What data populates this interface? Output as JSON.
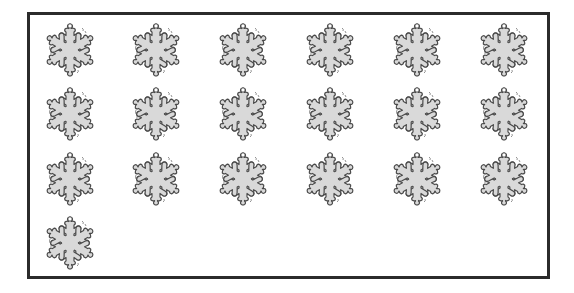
{
  "worksheet": {
    "item_icon": "snowflake-icon",
    "item_count": 19,
    "columns": 6,
    "rows": 4,
    "colors": {
      "border": "#2b2b2b",
      "flake_fill": "#d9d9d9",
      "flake_outline": "#4a4a4a",
      "background": "#ffffff"
    },
    "items": [
      {
        "row": 0,
        "col": 0
      },
      {
        "row": 0,
        "col": 1
      },
      {
        "row": 0,
        "col": 2
      },
      {
        "row": 0,
        "col": 3
      },
      {
        "row": 0,
        "col": 4
      },
      {
        "row": 0,
        "col": 5
      },
      {
        "row": 1,
        "col": 0
      },
      {
        "row": 1,
        "col": 1
      },
      {
        "row": 1,
        "col": 2
      },
      {
        "row": 1,
        "col": 3
      },
      {
        "row": 1,
        "col": 4
      },
      {
        "row": 1,
        "col": 5
      },
      {
        "row": 2,
        "col": 0
      },
      {
        "row": 2,
        "col": 1
      },
      {
        "row": 2,
        "col": 2
      },
      {
        "row": 2,
        "col": 3
      },
      {
        "row": 2,
        "col": 4
      },
      {
        "row": 2,
        "col": 5
      },
      {
        "row": 3,
        "col": 0
      }
    ]
  }
}
